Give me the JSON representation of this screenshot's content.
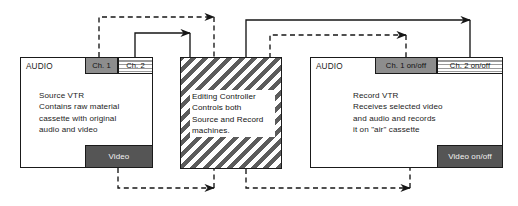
{
  "diagram": {
    "colors": {
      "line": "#1a1a1a",
      "tab_solid": "#8d8d8d",
      "video_tab": "#555555",
      "hatch": "#5c5c5c",
      "background": "#ffffff",
      "text": "#1c1c1c"
    }
  },
  "source_vtr": {
    "audio_label": "AUDIO",
    "description": "Source VTR\nContains raw material\ncassette with original\naudio and video",
    "tabs": [
      {
        "label": "Ch. 1",
        "style": "solid"
      },
      {
        "label": "Ch. 2",
        "style": "striped"
      }
    ],
    "video_tab": "Video"
  },
  "editing_controller": {
    "description": "Editing Controller\nControls both\nSource and Record\nmachines."
  },
  "record_vtr": {
    "audio_label": "AUDIO",
    "description": "Record VTR\nReceives selected video\nand audio and records\nit on \"air\" cassette",
    "tabs": [
      {
        "label": "Ch. 1 on/off",
        "style": "solid"
      },
      {
        "label": "Ch. 2 on/off",
        "style": "striped"
      }
    ],
    "video_tab": "Video on/off"
  },
  "connections": [
    {
      "name": "source-ch1-to-controller",
      "style": "dashed",
      "direction": "right"
    },
    {
      "name": "source-ch2-to-controller",
      "style": "solid",
      "direction": "right"
    },
    {
      "name": "controller-to-record-ch1",
      "style": "dashed",
      "direction": "right"
    },
    {
      "name": "controller-to-record-ch2",
      "style": "solid",
      "direction": "right"
    },
    {
      "name": "source-video-to-controller",
      "style": "dashed",
      "direction": "right"
    },
    {
      "name": "controller-to-record-video",
      "style": "dashed",
      "direction": "right"
    }
  ]
}
